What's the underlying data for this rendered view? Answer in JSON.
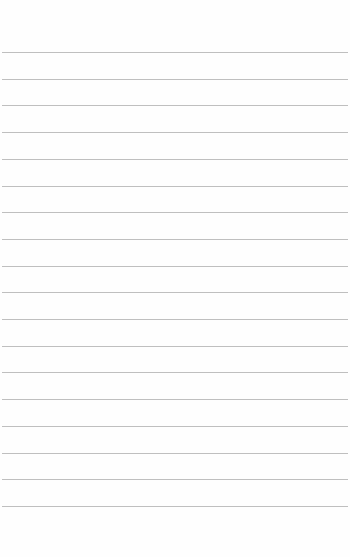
{
  "page": {
    "type": "lined-paper",
    "background_color": "#fefefe",
    "rule_color": "#bfbfbf",
    "rule_count": 18,
    "first_rule_y": 52,
    "rule_spacing": 26.7
  }
}
